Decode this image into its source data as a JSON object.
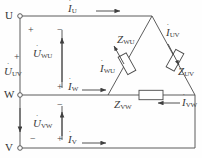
{
  "diagram": {
    "line_color": "#4a4a4a",
    "text_color": "#3b3b3b",
    "terminals": [
      {
        "id": "U",
        "label": "U"
      },
      {
        "id": "W",
        "label": "W"
      },
      {
        "id": "V",
        "label": "V"
      }
    ],
    "line_currents": [
      {
        "id": "I_U",
        "base": "I",
        "sub": "U",
        "dot": "˙",
        "direction": "right"
      },
      {
        "id": "I_W",
        "base": "I",
        "sub": "W",
        "dot": "˙",
        "direction": "right"
      },
      {
        "id": "I_V",
        "base": "I",
        "sub": "V",
        "dot": "˙",
        "direction": "right"
      }
    ],
    "phase_currents": [
      {
        "id": "I_WU",
        "base": "I",
        "sub": "WU",
        "dot": "˙",
        "direction": "up-left"
      },
      {
        "id": "I_UV",
        "base": "I",
        "sub": "UV",
        "dot": "˙",
        "direction": "down-right"
      },
      {
        "id": "I_VW",
        "base": "I",
        "sub": "VW",
        "dot": "˙",
        "direction": "left"
      }
    ],
    "voltages": [
      {
        "id": "U_UV",
        "base": "U",
        "sub": "UV",
        "dot": "˙",
        "direction": "down",
        "plus": "+",
        "minus": "−"
      },
      {
        "id": "U_WU",
        "base": "U",
        "sub": "WU",
        "dot": "˙",
        "direction": "up",
        "plus": "+",
        "minus": "−"
      },
      {
        "id": "U_VW",
        "base": "U",
        "sub": "VW",
        "dot": "˙",
        "direction": "up",
        "plus": "+",
        "minus": "−"
      }
    ],
    "impedances": [
      {
        "id": "Z_WU",
        "base": "Z",
        "sub": "WU",
        "arm": "left"
      },
      {
        "id": "Z_UV",
        "base": "Z",
        "sub": "UV",
        "arm": "right"
      },
      {
        "id": "Z_VW",
        "base": "Z",
        "sub": "VW",
        "arm": "bottom"
      }
    ],
    "polarity_marks": {
      "u_uv_plus": "+",
      "u_uv_minus": "−",
      "u_wu_plus": "+",
      "u_wu_minus": "−",
      "u_vw_plus": "+",
      "u_vw_minus": "−",
      "w_node_plus": "+",
      "v_node_plus": "+"
    }
  }
}
